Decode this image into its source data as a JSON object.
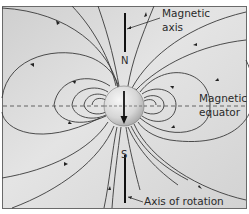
{
  "figure": {
    "labels": {
      "magnetic_axis_line1": "Magnetic",
      "magnetic_axis_line2": "axis",
      "magnetic_equator_line1": "Magnetic",
      "magnetic_equator_line2": "equator",
      "axis_of_rotation": "Axis of rotation",
      "north": "N",
      "south": "S"
    },
    "colors": {
      "background_light": "#ececec",
      "background_dark": "#c9c9c9",
      "field_line": "#3a3a3a",
      "frame": "#555555",
      "sphere_light": "#f4f4f4",
      "sphere_dark": "#a8a8a8",
      "axis_bar": "#111111"
    }
  }
}
